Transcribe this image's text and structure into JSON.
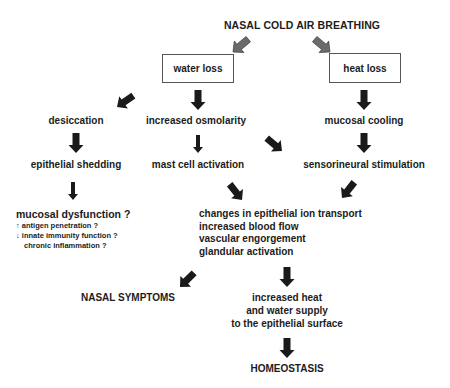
{
  "diagram": {
    "title": "NASAL COLD AIR BREATHING",
    "boxes": {
      "water_loss": "water loss",
      "heat_loss": "heat loss"
    },
    "nodes": {
      "desiccation": "desiccation",
      "increased_osmolarity": "increased osmolarity",
      "mucosal_cooling": "mucosal cooling",
      "epithelial_shedding": "epithelial shedding",
      "mast_cell_activation": "mast cell activation",
      "sensorineural_stimulation": "sensorineural stimulation",
      "mucosal_dysfunction": "mucosal dysfunction ?",
      "dysfunction_details": [
        {
          "marker": "↑",
          "text": "antigen penetration ?"
        },
        {
          "marker": "↓",
          "text": "innate immunity function ?"
        },
        {
          "marker": "",
          "text": "chronic inflammation ?"
        }
      ],
      "responses": [
        "changes in epithelial ion transport",
        "increased blood flow",
        "vascular engorgement",
        "glandular activation"
      ],
      "nasal_symptoms": "NASAL SYMPTOMS",
      "supply": [
        "increased heat",
        "and water supply",
        "to the epithelial surface"
      ],
      "homeostasis": "HOMEOSTASIS"
    },
    "colors": {
      "primary_arrow": "#1a1a1a",
      "title_arrow": "#6b6b6b",
      "text": "#1c1c1c",
      "box_border": "#555555"
    }
  }
}
